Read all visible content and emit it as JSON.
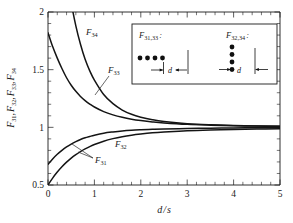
{
  "chart_data": {
    "type": "line",
    "title": "",
    "xlabel": "d / s",
    "ylabel": "F31, F32, F33, F34",
    "xlim": [
      0,
      5
    ],
    "ylim": [
      0.5,
      2
    ],
    "grid": false,
    "legend_position": "inline-labels",
    "x_ticks": [
      "0",
      "1",
      "2",
      "3",
      "4",
      "5"
    ],
    "y_ticks": [
      "0.5",
      "1",
      "1.5",
      "2"
    ],
    "x_minor_per_major": 5,
    "y_minor_per_major": 5,
    "series": [
      {
        "name": "F34",
        "label": "F34",
        "label_base": "F",
        "label_sub": "34",
        "x": [
          0.0,
          0.1,
          0.2,
          0.3,
          0.4,
          0.5,
          0.6,
          0.7,
          0.8,
          0.9,
          1.0,
          1.2,
          1.4,
          1.6,
          1.8,
          2.0,
          2.25,
          2.5,
          3.0,
          3.5,
          4.0,
          4.5,
          5.0
        ],
        "values": [
          4.0,
          3.45,
          3.0,
          2.62,
          2.32,
          2.08,
          1.88,
          1.72,
          1.59,
          1.49,
          1.41,
          1.285,
          1.205,
          1.15,
          1.113,
          1.088,
          1.066,
          1.051,
          1.032,
          1.022,
          1.016,
          1.012,
          1.009
        ]
      },
      {
        "name": "F33",
        "label": "F33",
        "label_base": "F",
        "label_sub": "33",
        "x": [
          0.0,
          0.1,
          0.2,
          0.3,
          0.4,
          0.5,
          0.6,
          0.7,
          0.8,
          0.9,
          1.0,
          1.2,
          1.4,
          1.6,
          1.8,
          2.0,
          2.25,
          2.5,
          3.0,
          3.5,
          4.0,
          4.5,
          5.0
        ],
        "values": [
          1.82,
          1.7,
          1.6,
          1.51,
          1.43,
          1.365,
          1.312,
          1.268,
          1.232,
          1.202,
          1.176,
          1.136,
          1.108,
          1.087,
          1.071,
          1.059,
          1.047,
          1.038,
          1.026,
          1.019,
          1.014,
          1.011,
          1.009
        ]
      },
      {
        "name": "F31",
        "label": "F31",
        "label_base": "F",
        "label_sub": "31",
        "x": [
          0.0,
          0.1,
          0.2,
          0.3,
          0.4,
          0.5,
          0.6,
          0.7,
          0.8,
          0.9,
          1.0,
          1.2,
          1.4,
          1.6,
          1.8,
          2.0,
          2.25,
          2.5,
          3.0,
          3.5,
          4.0,
          4.5,
          5.0
        ],
        "values": [
          0.68,
          0.726,
          0.766,
          0.8,
          0.83,
          0.855,
          0.876,
          0.894,
          0.909,
          0.921,
          0.932,
          0.949,
          0.96,
          0.969,
          0.975,
          0.979,
          0.983,
          0.986,
          0.99,
          0.993,
          0.995,
          0.996,
          0.997
        ]
      },
      {
        "name": "F32",
        "label": "F32",
        "label_base": "F",
        "label_sub": "32",
        "x": [
          0.0,
          0.1,
          0.2,
          0.3,
          0.4,
          0.5,
          0.6,
          0.7,
          0.8,
          0.9,
          1.0,
          1.2,
          1.4,
          1.6,
          1.8,
          2.0,
          2.25,
          2.5,
          3.0,
          3.5,
          4.0,
          4.5,
          5.0
        ],
        "values": [
          0.5,
          0.56,
          0.612,
          0.658,
          0.698,
          0.733,
          0.763,
          0.79,
          0.813,
          0.833,
          0.851,
          0.88,
          0.902,
          0.919,
          0.932,
          0.942,
          0.952,
          0.959,
          0.97,
          0.977,
          0.982,
          0.985,
          0.988
        ]
      }
    ]
  },
  "axes": {
    "ylabel_parts": [
      {
        "base": "F",
        "sub": "31"
      },
      {
        "base": "F",
        "sub": "32"
      },
      {
        "base": "F",
        "sub": "33"
      },
      {
        "base": "F",
        "sub": "34"
      }
    ],
    "xlabel_num": "d",
    "xlabel_sep": "/",
    "xlabel_den": "s",
    "ytick_0": "0.5",
    "ytick_1": "1",
    "ytick_2": "1.5",
    "ytick_3": "2",
    "xtick_0": "0",
    "xtick_1": "1",
    "xtick_2": "2",
    "xtick_3": "3",
    "xtick_4": "4",
    "xtick_5": "5"
  },
  "curve_labels": {
    "f34": {
      "base": "F",
      "sub": "34"
    },
    "f33": {
      "base": "F",
      "sub": "33"
    },
    "f31": {
      "base": "F",
      "sub": "31"
    },
    "f32": {
      "base": "F",
      "sub": "32"
    }
  },
  "inset": {
    "left": {
      "label_base": "F",
      "label_sub": "31,33",
      "label_colon": ":",
      "dim_label": "d",
      "dot_count": 4,
      "arrangement": "horizontal-row"
    },
    "right": {
      "label_base": "F",
      "label_sub": "32,34",
      "label_colon": ":",
      "dim_label": "d",
      "dot_count": 4,
      "arrangement": "vertical-column"
    }
  },
  "colors": {
    "curve": "#141414",
    "axis": "#1a1a1a",
    "background": "#ffffff"
  }
}
